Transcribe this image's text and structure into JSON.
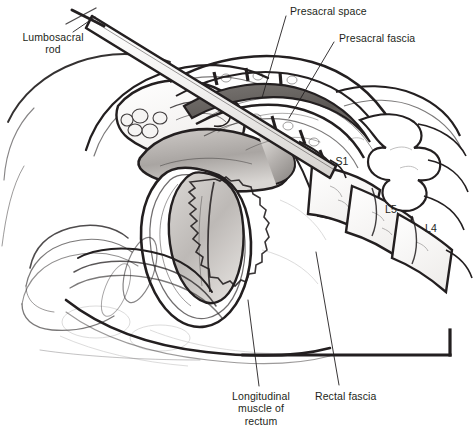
{
  "figure": {
    "kind": "anatomical-illustration",
    "view": "midsagittal section of pelvis and lumbosacral spine",
    "palette": {
      "background": "#ffffff",
      "ink": "#231f20",
      "label_text": "#231f20",
      "leader_line": "#231f20",
      "shading_light": "#d8d5d2",
      "shading_mid": "#b4b0ad",
      "shading_dark": "#6e6a67",
      "canal_fill": "#5f5b58"
    }
  },
  "labels": [
    {
      "id": "lumbosacral-rod",
      "text": "Lumbosacral\nrod",
      "x": 13,
      "y": 31,
      "align": "center",
      "leader": {
        "x1": 73,
        "y1": 32,
        "x2": 95,
        "y2": 17
      }
    },
    {
      "id": "presacral-space",
      "text": "Presacral space",
      "x": 290,
      "y": 5,
      "align": "left",
      "leader": {
        "x1": 286,
        "y1": 16,
        "x2": 262,
        "y2": 98
      }
    },
    {
      "id": "presacral-fascia",
      "text": "Presacral fascia",
      "x": 339,
      "y": 32,
      "align": "left",
      "leader": {
        "x1": 334,
        "y1": 42,
        "x2": 289,
        "y2": 118
      }
    },
    {
      "id": "longitudinal-muscle-of-rectum",
      "text": "Longitudinal\nmuscle of\nrectum",
      "x": 219,
      "y": 390,
      "align": "center",
      "leader": {
        "x1": 259,
        "y1": 386,
        "x2": 248,
        "y2": 300
      }
    },
    {
      "id": "rectal-fascia",
      "text": "Rectal fascia",
      "x": 315,
      "y": 390,
      "align": "left",
      "leader": {
        "x1": 339,
        "y1": 385,
        "x2": 316,
        "y2": 252
      }
    }
  ],
  "bone_labels": [
    {
      "id": "s1",
      "text": "S1",
      "x": 333,
      "y": 155
    },
    {
      "id": "l5",
      "text": "L5",
      "x": 382,
      "y": 203
    },
    {
      "id": "l4",
      "text": "L4",
      "x": 422,
      "y": 222
    }
  ],
  "instrument": {
    "name": "lumbosacral rod",
    "handle": "T-bar handle at proximal end",
    "tip_x": 92,
    "tip_y": 14,
    "distal_x": 330,
    "distal_y": 160
  }
}
